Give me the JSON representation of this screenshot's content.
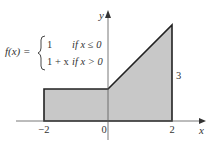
{
  "figure": {
    "function_label": "f(x) =",
    "piecewise": [
      {
        "expr": "1",
        "condition": "if x ≤ 0"
      },
      {
        "expr": "1 + x",
        "condition": "if x > 0"
      }
    ],
    "axis_labels": {
      "x": "x",
      "y": "y"
    },
    "x_ticks": [
      {
        "value": -2,
        "label": "−2"
      },
      {
        "value": 0,
        "label": "0"
      },
      {
        "value": 2,
        "label": "2"
      }
    ],
    "height_label": "3",
    "region": {
      "points": [
        [
          -2,
          0
        ],
        [
          -2,
          1
        ],
        [
          0,
          1
        ],
        [
          2,
          3
        ],
        [
          2,
          0
        ]
      ]
    },
    "colors": {
      "fill": "#c8c8c8",
      "stroke": "#222222",
      "axis": "#555555"
    }
  }
}
